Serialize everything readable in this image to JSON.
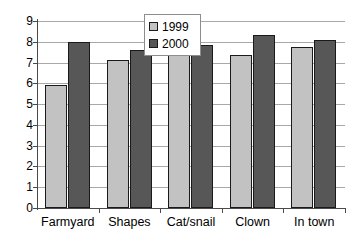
{
  "chart_data": {
    "type": "bar",
    "title": "",
    "xlabel": "",
    "ylabel": "",
    "ylim": [
      0,
      9
    ],
    "yticks": [
      0,
      1,
      2,
      3,
      4,
      5,
      6,
      7,
      8,
      9
    ],
    "ytick_labels": [
      "0",
      "1",
      "2",
      "3",
      "4",
      "5",
      "6",
      "7",
      "8",
      "9"
    ],
    "grid": true,
    "legend_position": "top-center",
    "categories": [
      "Farmyard",
      "Shapes",
      "Cat/snail",
      "Clown",
      "In town"
    ],
    "series": [
      {
        "name": "1999",
        "color": "#c2c2c2",
        "values": [
          5.9,
          7.1,
          7.35,
          7.35,
          7.75
        ]
      },
      {
        "name": "2000",
        "color": "#575757",
        "values": [
          8.0,
          7.6,
          7.85,
          8.35,
          8.1
        ]
      }
    ]
  },
  "legend": {
    "items": [
      {
        "label": "1999",
        "swatch": "legend-swatch-1999"
      },
      {
        "label": "2000",
        "swatch": "legend-swatch-2000"
      }
    ]
  },
  "colors": {
    "series_1999": "#c2c2c2",
    "series_2000": "#575757",
    "grid": "#a8a8a8",
    "axis": "#4a4a4a",
    "bar_outline": "#1a1a1a",
    "background": "#ffffff"
  }
}
